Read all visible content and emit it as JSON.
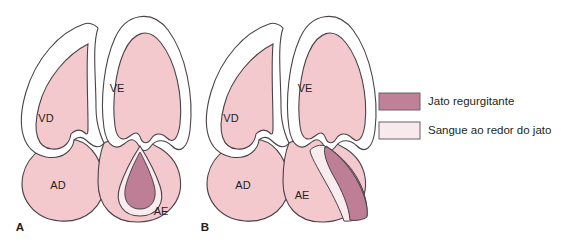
{
  "figure": {
    "background_color": "#ffffff",
    "panels": [
      {
        "id": "panel-a",
        "label": "A",
        "jet_type": "central",
        "chambers": [
          {
            "id": "vd",
            "label": "VD",
            "name": "ventriculo-direito"
          },
          {
            "id": "ve",
            "label": "VE",
            "name": "ventriculo-esquerdo"
          },
          {
            "id": "ad",
            "label": "AD",
            "name": "atrio-direito"
          },
          {
            "id": "ae",
            "label": "AE",
            "name": "atrio-esquerdo"
          }
        ]
      },
      {
        "id": "panel-b",
        "label": "B",
        "jet_type": "eccentric",
        "chambers": [
          {
            "id": "vd",
            "label": "VD",
            "name": "ventriculo-direito"
          },
          {
            "id": "ve",
            "label": "VE",
            "name": "ventriculo-esquerdo"
          },
          {
            "id": "ad",
            "label": "AD",
            "name": "atrio-direito"
          },
          {
            "id": "ae",
            "label": "AE",
            "name": "atrio-esquerdo"
          }
        ]
      }
    ],
    "legend": {
      "items": [
        {
          "swatch_color": "#c08098",
          "label": "Jato regurgitante"
        },
        {
          "swatch_color": "#f7e9ec",
          "label": "Sangue ao redor do jato"
        }
      ]
    },
    "colors": {
      "chamber_fill": "#f4c9ce",
      "myocardium_fill": "#ffffff",
      "jet_fill": "#bd7e96",
      "halo_fill": "#f8ecef",
      "outline": "#4a4248",
      "text": "#231f20"
    }
  }
}
